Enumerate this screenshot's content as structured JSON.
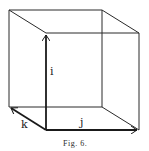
{
  "figure": {
    "caption": "Fig. 6."
  },
  "vectors": [
    {
      "name": "i",
      "label": "i",
      "direction": "up"
    },
    {
      "name": "j",
      "label": "j",
      "direction": "right"
    },
    {
      "name": "k",
      "label": "k",
      "direction": "back-left"
    }
  ],
  "colors": {
    "ink": "#1a1a1a",
    "background": "#ffffff"
  }
}
